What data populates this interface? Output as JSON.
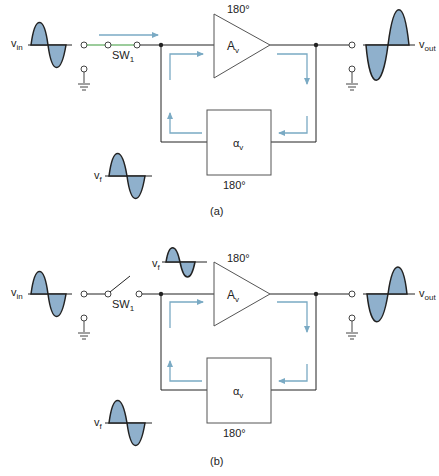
{
  "colors": {
    "wire": "#222222",
    "signal_fill": "#8fb0cc",
    "arrow": "#7aaac4",
    "green_wire": "#3a9a3a",
    "terminal": "#444444"
  },
  "diagram_a": {
    "caption": "(a)",
    "vin_label": "v",
    "vin_sub": "in",
    "switch_label": "SW",
    "switch_sub": "1",
    "switch_state": "closed",
    "amp_label": "A",
    "amp_sub": "v",
    "amp_phase": "180°",
    "fb_label": "α",
    "fb_sub": "v",
    "fb_phase": "180°",
    "vout_label": "v",
    "vout_sub": "out",
    "vf_label": "v",
    "vf_sub": "f"
  },
  "diagram_b": {
    "caption": "(b)",
    "vin_label": "v",
    "vin_sub": "in",
    "switch_label": "SW",
    "switch_sub": "1",
    "switch_state": "open",
    "amp_label": "A",
    "amp_sub": "v",
    "amp_phase": "180°",
    "fb_label": "α",
    "fb_sub": "v",
    "fb_phase": "180°",
    "vout_label": "v",
    "vout_sub": "out",
    "vf_top_label": "v",
    "vf_top_sub": "f",
    "vf_label": "v",
    "vf_sub": "f"
  }
}
